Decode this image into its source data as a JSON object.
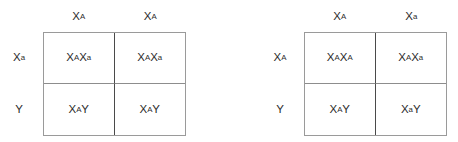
{
  "diagram": {
    "type": "punnett-square-pair",
    "squares": [
      {
        "id": "left",
        "name": "carrier-mother-affected-father-cross",
        "column_headers": [
          {
            "base": "X",
            "sup": "A"
          },
          {
            "base": "X",
            "sup": "A"
          }
        ],
        "row_headers": [
          {
            "base": "X",
            "sup": "a"
          },
          {
            "base": "Y",
            "sup": ""
          }
        ],
        "cells": [
          [
            {
              "parts": [
                {
                  "base": "X",
                  "sup": "A"
                },
                {
                  "base": "X",
                  "sup": "a"
                }
              ]
            },
            {
              "parts": [
                {
                  "base": "X",
                  "sup": "A"
                },
                {
                  "base": "X",
                  "sup": "a"
                }
              ]
            }
          ],
          [
            {
              "parts": [
                {
                  "base": "X",
                  "sup": "A"
                },
                {
                  "base": "Y",
                  "sup": ""
                }
              ]
            },
            {
              "parts": [
                {
                  "base": "X",
                  "sup": "A"
                },
                {
                  "base": "Y",
                  "sup": ""
                }
              ]
            }
          ]
        ]
      },
      {
        "id": "right",
        "name": "carrier-father-normal-mother-cross",
        "column_headers": [
          {
            "base": "X",
            "sup": "A"
          },
          {
            "base": "X",
            "sup": "a"
          }
        ],
        "row_headers": [
          {
            "base": "X",
            "sup": "A"
          },
          {
            "base": "Y",
            "sup": ""
          }
        ],
        "cells": [
          [
            {
              "parts": [
                {
                  "base": "X",
                  "sup": "A"
                },
                {
                  "base": "X",
                  "sup": "A"
                }
              ]
            },
            {
              "parts": [
                {
                  "base": "X",
                  "sup": "A"
                },
                {
                  "base": "X",
                  "sup": "a"
                }
              ]
            }
          ],
          [
            {
              "parts": [
                {
                  "base": "X",
                  "sup": "A"
                },
                {
                  "base": "Y",
                  "sup": ""
                }
              ]
            },
            {
              "parts": [
                {
                  "base": "X",
                  "sup": "a"
                },
                {
                  "base": "Y",
                  "sup": ""
                }
              ]
            }
          ]
        ]
      }
    ],
    "colors": {
      "text": "#2b2b2b",
      "outer_border": "#9a9a9a",
      "vertical_divider": "#4a4a4a",
      "horizontal_divider": "#8d8d8d",
      "background": "#ffffff"
    }
  }
}
